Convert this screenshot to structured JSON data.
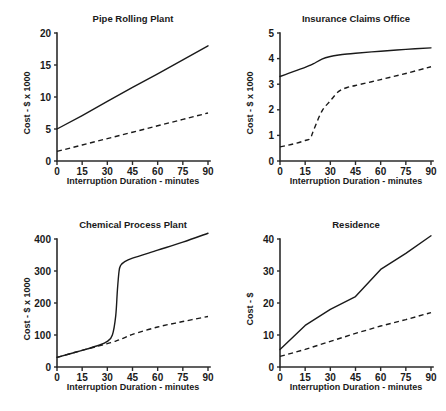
{
  "figure": {
    "title": "",
    "layout": "2x2 grid of line charts"
  },
  "chart_data": [
    {
      "id": "pipe-rolling-plant",
      "type": "line",
      "title": "Pipe Rolling Plant",
      "xlabel": "Interruption Duration - minutes",
      "ylabel": "Cost - $ x 1000",
      "xlim": [
        0,
        90
      ],
      "ylim": [
        0,
        20
      ],
      "xticks": [
        0,
        15,
        30,
        45,
        60,
        75,
        90
      ],
      "yticks": [
        0,
        5,
        10,
        15,
        20
      ],
      "grid": false,
      "legend": "none",
      "x": [
        0,
        15,
        30,
        45,
        60,
        75,
        90
      ],
      "series": [
        {
          "name": "upper",
          "style": "solid",
          "values": [
            5.0,
            7.1,
            9.3,
            11.5,
            13.6,
            15.8,
            18.0
          ]
        },
        {
          "name": "lower",
          "style": "dashed",
          "values": [
            1.5,
            2.5,
            3.5,
            4.5,
            5.5,
            6.5,
            7.5
          ]
        }
      ]
    },
    {
      "id": "insurance-claims-office",
      "type": "line",
      "title": "Insurance Claims Office",
      "xlabel": "Interruption Duration - minutes",
      "ylabel": "Cost - $ x 1000",
      "xlim": [
        0,
        90
      ],
      "ylim": [
        0,
        5
      ],
      "xticks": [
        0,
        15,
        30,
        45,
        60,
        75,
        90
      ],
      "yticks": [
        0,
        1,
        2,
        3,
        4,
        5
      ],
      "grid": false,
      "legend": "none",
      "x": [
        0,
        5,
        10,
        15,
        18,
        20,
        25,
        30,
        35,
        40,
        45,
        60,
        75,
        90
      ],
      "series": [
        {
          "name": "upper",
          "style": "solid",
          "values": [
            3.3,
            3.42,
            3.54,
            3.66,
            3.74,
            3.8,
            3.98,
            4.08,
            4.14,
            4.18,
            4.21,
            4.29,
            4.36,
            4.42
          ]
        },
        {
          "name": "lower",
          "style": "dashed",
          "values": [
            0.55,
            0.62,
            0.7,
            0.8,
            0.88,
            1.2,
            1.95,
            2.35,
            2.72,
            2.87,
            2.95,
            3.18,
            3.42,
            3.68
          ]
        }
      ]
    },
    {
      "id": "chemical-process-plant",
      "type": "line",
      "title": "Chemical Process Plant",
      "xlabel": "Interruption Duration - minutes",
      "ylabel": "Cost - $ x 1000",
      "xlim": [
        0,
        90
      ],
      "ylim": [
        0,
        400
      ],
      "xticks": [
        0,
        15,
        30,
        45,
        60,
        75,
        90
      ],
      "yticks": [
        0,
        100,
        200,
        300,
        400
      ],
      "grid": false,
      "legend": "none",
      "x": [
        0,
        15,
        25,
        30,
        33,
        35,
        36,
        37,
        38,
        40,
        45,
        60,
        75,
        90
      ],
      "series": [
        {
          "name": "upper",
          "style": "solid",
          "values": [
            30,
            52,
            68,
            80,
            100,
            160,
            240,
            300,
            318,
            328,
            340,
            365,
            390,
            418
          ]
        },
        {
          "name": "lower",
          "style": "dashed",
          "values": [
            30,
            52,
            66,
            73,
            78,
            81,
            83,
            85,
            87,
            91,
            102,
            125,
            142,
            158
          ]
        }
      ]
    },
    {
      "id": "residence",
      "type": "line",
      "title": "Residence",
      "xlabel": "Interruption Duration - minutes",
      "ylabel": "Cost - $",
      "xlim": [
        0,
        90
      ],
      "ylim": [
        0,
        40
      ],
      "xticks": [
        0,
        15,
        30,
        45,
        60,
        75,
        90
      ],
      "yticks": [
        0,
        10,
        20,
        30,
        40
      ],
      "grid": false,
      "legend": "none",
      "x": [
        0,
        15,
        30,
        45,
        60,
        75,
        90
      ],
      "series": [
        {
          "name": "upper",
          "style": "solid",
          "values": [
            5.5,
            13.0,
            18.0,
            22.0,
            30.5,
            35.5,
            41.0
          ]
        },
        {
          "name": "lower",
          "style": "dashed",
          "values": [
            3.3,
            5.5,
            8.0,
            10.5,
            12.8,
            14.8,
            17.0
          ]
        }
      ]
    }
  ]
}
